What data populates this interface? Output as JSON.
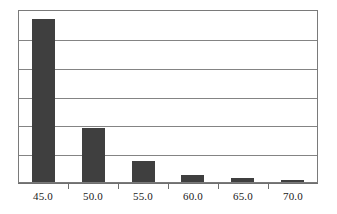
{
  "chart_data": {
    "type": "bar",
    "title": "",
    "subtitle": "",
    "xlabel": "",
    "ylabel": "",
    "categories": [
      "45.0",
      "50.0",
      "55.0",
      "60.0",
      "65.0",
      "70.0"
    ],
    "values": [
      5.65,
      1.86,
      0.72,
      0.24,
      0.14,
      0.07
    ],
    "ylim": [
      0,
      6
    ],
    "y_tick_labels": [],
    "y_gridline_count": 6,
    "grid": true,
    "legend": false,
    "legend_position": "none",
    "series": [
      {
        "name": "frequency",
        "values": [
          5.65,
          1.86,
          0.72,
          0.24,
          0.14,
          0.07
        ]
      }
    ],
    "annotations": []
  },
  "style": {
    "bar_color": "#3f3f3f",
    "gridline_color": "#848484",
    "frame_color": "#7a7a7a",
    "axis_color": "#6f6f6f",
    "background_color": "#ffffff",
    "label_color": "#1a1a1a"
  }
}
